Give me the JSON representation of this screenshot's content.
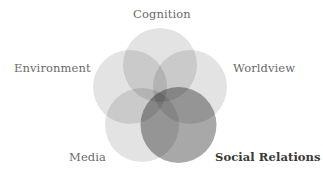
{
  "diagram": {
    "type": "five-circle venn",
    "background": "#ffffff",
    "circles": [
      {
        "id": "cognition",
        "label": "Cognition",
        "cx": 160,
        "cy": 65,
        "r": 37,
        "fill": "#000000",
        "opacity": 0.11,
        "emphasized": false
      },
      {
        "id": "environment",
        "label": "Environment",
        "cx": 130,
        "cy": 87,
        "r": 37,
        "fill": "#000000",
        "opacity": 0.11,
        "emphasized": false
      },
      {
        "id": "worldview",
        "label": "Worldview",
        "cx": 190,
        "cy": 87,
        "r": 37,
        "fill": "#000000",
        "opacity": 0.11,
        "emphasized": false
      },
      {
        "id": "media",
        "label": "Media",
        "cx": 142,
        "cy": 125,
        "r": 37,
        "fill": "#000000",
        "opacity": 0.11,
        "emphasized": false
      },
      {
        "id": "social-relations",
        "label": "Social Relations",
        "cx": 178.5,
        "cy": 125,
        "r": 38,
        "fill": "#000000",
        "opacity": 0.34,
        "emphasized": true
      }
    ],
    "labels": {
      "cognition": "Cognition",
      "environment": "Environment",
      "worldview": "Worldview",
      "media": "Media",
      "social_relations": "Social Relations"
    },
    "colors": {
      "label_text": "#6a6a6a",
      "emphasized_label_text": "#3a3a3a"
    }
  }
}
